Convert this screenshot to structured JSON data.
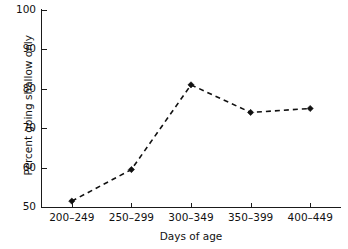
{
  "chart_data": {
    "type": "line",
    "title": "",
    "xlabel": "Days of age",
    "ylabel": "Percent going shallow only",
    "categories": [
      "200–249",
      "250–299",
      "300–349",
      "350–399",
      "400–449"
    ],
    "values": [
      51.5,
      59.5,
      81,
      74,
      75
    ],
    "ylim": [
      50,
      100
    ],
    "yticks": [
      50,
      60,
      70,
      80,
      90,
      100
    ],
    "ytick_labels": [
      "50",
      "60",
      "70",
      "80",
      "90",
      "100"
    ],
    "grid": false,
    "legend": false,
    "line_style": "dashed",
    "marker": "filled-diamond",
    "series_color": "#111111",
    "background_color": "#ffffff"
  },
  "axes": {
    "y_title": "Percent going shallow only",
    "x_title": "Days of age"
  }
}
